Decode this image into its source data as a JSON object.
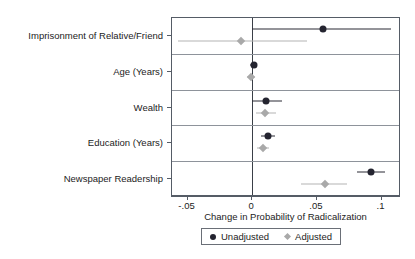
{
  "chart_data": {
    "type": "scatter",
    "title": "",
    "xlabel": "Change in Probability of Radicalization",
    "ylabel": "",
    "xlim": [
      -0.062,
      0.115
    ],
    "xticks": [
      -0.05,
      0,
      0.05,
      0.1
    ],
    "xticklabels": [
      "-.05",
      "0",
      ".05",
      ".1"
    ],
    "grid": true,
    "grid_orientation": "horizontal",
    "legend_position": "below",
    "zero_reference_line": 0,
    "categories": [
      "Imprisonment of Relative/Friend",
      "Age (Years)",
      "Wealth",
      "Education (Years)",
      "Newspaper Readership"
    ],
    "series": [
      {
        "name": "Unadjusted",
        "marker": "circle",
        "color": "#242430",
        "values": [
          0.055,
          0.001,
          0.011,
          0.012,
          0.092
        ],
        "ci_low": [
          0.0,
          -0.002,
          0.0,
          0.007,
          0.081
        ],
        "ci_high": [
          0.107,
          0.004,
          0.023,
          0.018,
          0.103
        ]
      },
      {
        "name": "Adjusted",
        "marker": "diamond",
        "color": "#a9a9a9",
        "values": [
          -0.009,
          -0.001,
          0.01,
          0.008,
          0.056
        ],
        "ci_low": [
          -0.057,
          -0.004,
          0.003,
          0.004,
          0.038
        ],
        "ci_high": [
          0.042,
          0.002,
          0.018,
          0.013,
          0.073
        ]
      }
    ]
  },
  "legend": {
    "items": [
      {
        "label": "Unadjusted",
        "marker": "circle-marker-icon",
        "color": "#242430"
      },
      {
        "label": "Adjusted",
        "marker": "diamond-marker-icon",
        "color": "#a9a9a9"
      }
    ]
  },
  "axis": {
    "x_title": "Change in Probability of Radicalization"
  }
}
